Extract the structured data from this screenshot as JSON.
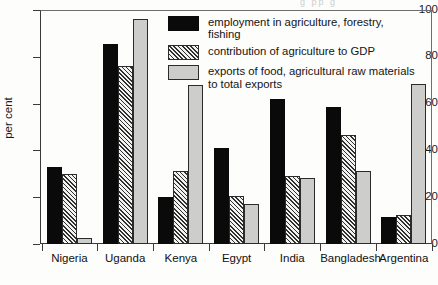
{
  "figure": {
    "background_color": "#fdfdfb",
    "scan_artifact_text": "g          pp                g"
  },
  "chart_data": {
    "type": "bar",
    "title": "",
    "subtitle": "",
    "xlabel": "",
    "ylabel": "per cent",
    "ylim": [
      0,
      100
    ],
    "yticks": [
      0,
      20,
      40,
      60,
      80,
      100
    ],
    "ytick_labels": [
      "0",
      "20",
      "40",
      "60",
      "80",
      "100"
    ],
    "grid": false,
    "legend_position": "upper right (inside axes)",
    "categories": [
      "Nigeria",
      "Uganda",
      "Kenya",
      "Egypt",
      "India",
      "Bangladesh",
      "Argentina"
    ],
    "series": [
      {
        "name": "employment in agriculture, forestry, fishing",
        "color": "#0a0a0a",
        "pattern": "solid",
        "values": [
          33,
          85.5,
          20,
          41,
          62,
          58.5,
          11.5
        ]
      },
      {
        "name": "contribution of agriculture to GDP",
        "color": "#f2f2f0",
        "pattern": "diagonal-hatch",
        "values": [
          30,
          76,
          31,
          20.5,
          29,
          46.5,
          12.5
        ]
      },
      {
        "name": "exports of food, agricultural raw materials to total exports",
        "color": "#cdcdcb",
        "pattern": "solid-light",
        "values": [
          2.5,
          96,
          68,
          17,
          28,
          31,
          68.5
        ]
      }
    ]
  },
  "legend": {
    "entries": [
      {
        "label_line1": "employment in agriculture, forestry,",
        "label_line2": "fishing",
        "swatch": "black-solid-swatch"
      },
      {
        "label_line1": "contribution of agriculture to GDP",
        "label_line2": "",
        "swatch": "hatched-swatch"
      },
      {
        "label_line1": "exports of food, agricultural raw materials",
        "label_line2": "to total exports",
        "swatch": "grey-solid-swatch"
      }
    ]
  }
}
